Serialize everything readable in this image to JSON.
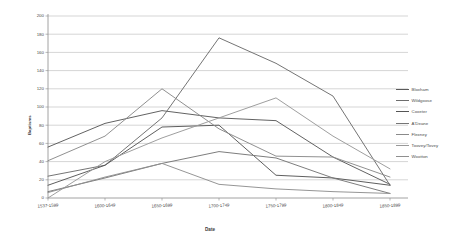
{
  "chart_data": {
    "type": "line",
    "title": "",
    "xlabel": "Date",
    "ylabel": "Baptisms",
    "categories": [
      "1537-1599",
      "1600-1649",
      "1650-1699",
      "1700-1749",
      "1750-1799",
      "1800-1849",
      "1850-1899"
    ],
    "ylim": [
      0,
      200
    ],
    "ytick_step": 20,
    "yticks": [
      "0",
      "20",
      "40",
      "60",
      "80",
      "100",
      "120",
      "140",
      "160",
      "180",
      "200"
    ],
    "grid": "horizontal",
    "legend_position": "right",
    "series": [
      {
        "name": "Bloxham",
        "color": "#5a5a5a",
        "values": [
          56,
          82,
          96,
          88,
          85,
          45,
          15
        ]
      },
      {
        "name": "Wildgoose",
        "color": "#6d6d6d",
        "values": [
          24,
          36,
          88,
          176,
          148,
          112,
          14
        ]
      },
      {
        "name": "Coxeter",
        "color": "#555555",
        "values": [
          14,
          36,
          78,
          80,
          25,
          22,
          14
        ]
      },
      {
        "name": "A'Deane",
        "color": "#767676",
        "values": [
          7,
          22,
          38,
          51,
          44,
          22,
          5
        ]
      },
      {
        "name": "Flexney",
        "color": "#8a8a8a",
        "values": [
          41,
          68,
          120,
          76,
          46,
          45,
          23
        ]
      },
      {
        "name": "Toovey/Tovey",
        "color": "#999999",
        "values": [
          0,
          40,
          66,
          88,
          110,
          68,
          32
        ]
      },
      {
        "name": "Wootton",
        "color": "#8f8f8f",
        "values": [
          6,
          23,
          38,
          15,
          10,
          7,
          5
        ]
      }
    ]
  },
  "axes": {
    "y_title": "Baptisms",
    "x_title": "Date"
  }
}
